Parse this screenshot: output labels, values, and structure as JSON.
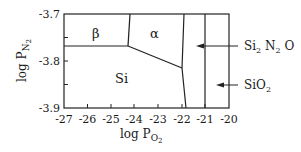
{
  "diagram": {
    "type": "phase-diagram",
    "x_axis": {
      "label_main": "log P",
      "label_sub": "O",
      "label_subsub": "2",
      "ticks": [
        "-27",
        "-26",
        "-25",
        "-24",
        "-23",
        "-22",
        "-21",
        "-20"
      ],
      "range": [
        -27,
        -20
      ]
    },
    "y_axis": {
      "label_main": "log P",
      "label_sub": "N",
      "label_subsub": "2",
      "ticks": [
        "-3.7",
        "-3.8",
        "-3.9"
      ],
      "range": [
        -3.9,
        -3.7
      ]
    },
    "regions": {
      "beta": "β",
      "alpha": "α",
      "si": "Si"
    },
    "annotations": {
      "si2n2o": {
        "a": "Si",
        "a_sub": "2",
        "b": " N",
        "b_sub": "2",
        "c": " O"
      },
      "sio2": {
        "a": "SiO",
        "a_sub": "2"
      }
    }
  }
}
